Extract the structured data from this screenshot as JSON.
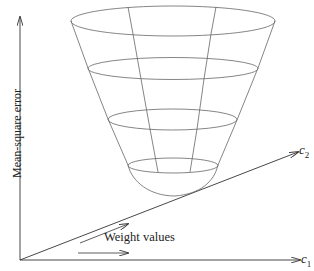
{
  "diagram": {
    "y_axis_label": "Mean-square error",
    "x_axis_label": {
      "symbol": "c",
      "subscript": "1"
    },
    "z_axis_label": {
      "symbol": "c",
      "subscript": "2"
    },
    "annotation": "Weight values",
    "colors": {
      "line": "#555555",
      "axis": "#333333",
      "text": "#222222",
      "background": "#ffffff"
    }
  }
}
